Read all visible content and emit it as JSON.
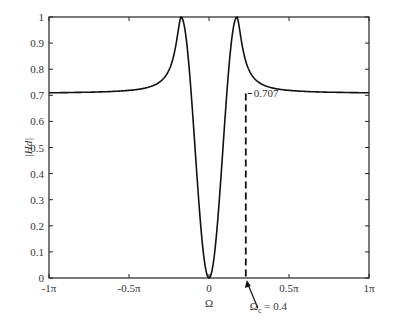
{
  "chart_data": {
    "type": "line",
    "title": "",
    "xlabel": "Ω",
    "ylabel": "|Hd|",
    "xlim": [
      -3.1416,
      3.1416
    ],
    "ylim": [
      0,
      1
    ],
    "grid": false,
    "x_ticks": [
      "-1π",
      "-0.5π",
      "0",
      "0.5π",
      "1π"
    ],
    "y_ticks": [
      "0",
      "0.1",
      "0.2",
      "0.3",
      "0.4",
      "0.5",
      "0.6",
      "0.7",
      "0.8",
      "0.9",
      "1"
    ],
    "series": [
      {
        "name": "|Hd(Ω)|",
        "x_over_pi": [
          -1.0,
          -0.8,
          -0.6,
          -0.5,
          -0.4,
          -0.3,
          -0.25,
          -0.2,
          -0.175,
          -0.15,
          -0.12,
          -0.08,
          -0.04,
          0.0,
          0.04,
          0.08,
          0.12,
          0.15,
          0.175,
          0.2,
          0.25,
          0.3,
          0.4,
          0.5,
          0.6,
          0.8,
          1.0
        ],
        "values": [
          0.707,
          0.709,
          0.715,
          0.722,
          0.738,
          0.775,
          0.82,
          0.92,
          1.0,
          0.93,
          0.62,
          0.3,
          0.08,
          0.0,
          0.08,
          0.3,
          0.62,
          0.93,
          1.0,
          0.92,
          0.82,
          0.775,
          0.738,
          0.722,
          0.715,
          0.709,
          0.707
        ]
      }
    ],
    "annotations": [
      {
        "text": "0.707",
        "x_over_pi": 0.23,
        "y": 0.707
      },
      {
        "text": "Ω_c = 0.4",
        "x_over_pi": 0.23,
        "y": 0,
        "arrow": true
      }
    ],
    "cutoff_marker": {
      "x_over_pi": 0.23,
      "y_top": 0.707,
      "style": "dashed"
    }
  },
  "labels": {
    "x_axis": "Ω",
    "y_axis": "|Hd|",
    "annotation_level": "0.707",
    "annotation_cutoff_prefix": "Ω",
    "annotation_cutoff_sub": "c",
    "annotation_cutoff_value": " = 0.4"
  }
}
